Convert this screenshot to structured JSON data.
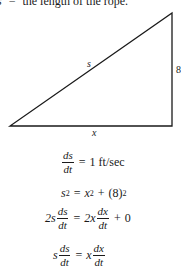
{
  "caption": {
    "var": "s",
    "equals": "=",
    "text": "the length of the rope."
  },
  "diagram": {
    "type": "right-triangle",
    "vertices": {
      "left": [
        10,
        126
      ],
      "right_angle": [
        172,
        126
      ],
      "top": [
        172,
        13
      ]
    },
    "labels": {
      "hypotenuse": "s",
      "vertical": "8",
      "base": "x"
    },
    "stroke_color": "#1a1a1a"
  },
  "equations": [
    {
      "id": "rate",
      "lhs_num": "ds",
      "lhs_den": "dt",
      "op": "=",
      "rhs": "1 ft/sec"
    },
    {
      "id": "pythagoras",
      "lhs_base": "s",
      "lhs_exp": "2",
      "op": "=",
      "rhs_term1_base": "x",
      "rhs_term1_exp": "2",
      "plus": "+",
      "rhs_term2_base": "(8)",
      "rhs_term2_exp": "2"
    },
    {
      "id": "differentiated",
      "lhs_coef": "2s",
      "lhs_num": "ds",
      "lhs_den": "dt",
      "op": "=",
      "rhs_coef": "2x",
      "rhs_num": "dx",
      "rhs_den": "dt",
      "plus": "+",
      "rhs_const": "0"
    },
    {
      "id": "simplified",
      "lhs_coef": "s",
      "lhs_num": "ds",
      "lhs_den": "dt",
      "op": "=",
      "rhs_coef": "x",
      "rhs_num": "dx",
      "rhs_den": "dt"
    }
  ]
}
